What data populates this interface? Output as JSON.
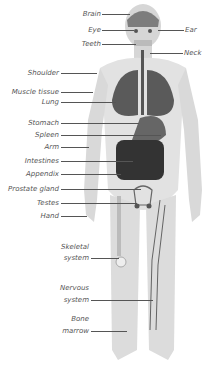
{
  "diagram": {
    "colors": {
      "skin": "#d9d9d9",
      "organ": "#5a5a5a",
      "dark": "#333333",
      "label": "#555555"
    },
    "labels_left": [
      {
        "text": "Brain",
        "y": 14
      },
      {
        "text": "Eye",
        "y": 30
      },
      {
        "text": "Teeth",
        "y": 44
      },
      {
        "text": "Shoulder",
        "y": 73
      },
      {
        "text": "Muscle tissue",
        "y": 92
      },
      {
        "text": "Lung",
        "y": 102
      },
      {
        "text": "Stomach",
        "y": 123
      },
      {
        "text": "Spleen",
        "y": 135
      },
      {
        "text": "Arm",
        "y": 147
      },
      {
        "text": "Intestines",
        "y": 161
      },
      {
        "text": "Appendix",
        "y": 174
      },
      {
        "text": "Prostate gland",
        "y": 189
      },
      {
        "text": "Testes",
        "y": 203
      },
      {
        "text": "Hand",
        "y": 216
      }
    ],
    "labels_right": [
      {
        "text": "Ear",
        "y": 30
      },
      {
        "text": "Neck",
        "y": 53
      }
    ],
    "labels_lower": [
      {
        "line1": "Skeletal",
        "line2": "system"
      },
      {
        "line1": "Nervous",
        "line2": "system"
      },
      {
        "line1": "Bone",
        "line2": "marrow"
      }
    ]
  }
}
